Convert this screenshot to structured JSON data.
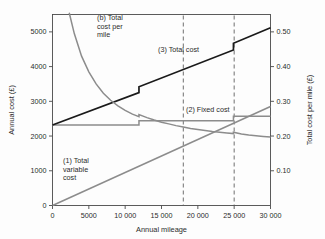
{
  "chart_data": {
    "type": "line",
    "title": "",
    "xlabel": "Annual mileage",
    "ylabel": "Annual cost (£)",
    "y2label": "Total cost per mile (£)",
    "xlim": [
      0,
      30000
    ],
    "ylim": [
      0,
      5500
    ],
    "y2lim": [
      0,
      0.55
    ],
    "grid": false,
    "legend": "annotations-inline",
    "xticks": [
      0,
      5000,
      10000,
      15000,
      20000,
      25000,
      30000
    ],
    "xticklabels": [
      "0",
      "5000",
      "10 000",
      "15 000",
      "20 000",
      "25 000",
      "30 000"
    ],
    "yticks": [
      0,
      1000,
      2000,
      3000,
      4000,
      5000
    ],
    "yticklabels": [
      "0",
      "1000",
      "2000",
      "3000",
      "4000",
      "5000"
    ],
    "y2ticks": [
      0.1,
      0.2,
      0.3,
      0.4,
      0.5
    ],
    "y2ticklabels": [
      "0.10",
      "0.20",
      "0.30",
      "0.40",
      "0.50"
    ],
    "series": [
      {
        "name": "(1) Total variable cost",
        "axis": "left",
        "color": "#8c8c8c",
        "style": "solid",
        "points": [
          [
            0,
            0
          ],
          [
            30000,
            2850
          ]
        ]
      },
      {
        "name": "(2) Fixed cost",
        "axis": "left",
        "color": "#8c8c8c",
        "style": "step",
        "points": [
          [
            0,
            2320
          ],
          [
            11900,
            2320
          ],
          [
            11900,
            2440
          ],
          [
            24900,
            2440
          ],
          [
            24900,
            2570
          ],
          [
            30000,
            2570
          ]
        ]
      },
      {
        "name": "(3) Total cost",
        "axis": "left",
        "color": "#1a1a1a",
        "style": "step",
        "points": [
          [
            0,
            2320
          ],
          [
            11900,
            3250
          ],
          [
            11900,
            3420
          ],
          [
            24900,
            4480
          ],
          [
            24900,
            4670
          ],
          [
            30000,
            5120
          ]
        ]
      },
      {
        "name": "(b) Total cost per mile",
        "axis": "right",
        "color": "#8c8c8c",
        "style": "curve",
        "points": [
          [
            2300,
            0.555
          ],
          [
            3000,
            0.495
          ],
          [
            4000,
            0.43
          ],
          [
            5000,
            0.385
          ],
          [
            6000,
            0.35
          ],
          [
            7000,
            0.323
          ],
          [
            8000,
            0.303
          ],
          [
            9000,
            0.287
          ],
          [
            10000,
            0.274
          ],
          [
            11000,
            0.263
          ],
          [
            11900,
            0.256
          ],
          [
            11900,
            0.262
          ],
          [
            13000,
            0.253
          ],
          [
            14000,
            0.246
          ],
          [
            15000,
            0.24
          ],
          [
            16000,
            0.235
          ],
          [
            17000,
            0.23
          ],
          [
            18000,
            0.226
          ],
          [
            19000,
            0.222
          ],
          [
            20000,
            0.219
          ],
          [
            21000,
            0.216
          ],
          [
            22000,
            0.213
          ],
          [
            23000,
            0.211
          ],
          [
            24000,
            0.209
          ],
          [
            24900,
            0.207
          ],
          [
            24900,
            0.211
          ],
          [
            26000,
            0.206
          ],
          [
            27000,
            0.203
          ],
          [
            28000,
            0.201
          ],
          [
            29000,
            0.199
          ],
          [
            30000,
            0.197
          ]
        ]
      }
    ],
    "reference_lines": [
      {
        "name": "dashed-18000",
        "x": 18000,
        "style": "dashed",
        "color": "#606060"
      },
      {
        "name": "dashed-25000",
        "x": 25000,
        "style": "dashed",
        "color": "#606060"
      }
    ],
    "annotations": [
      {
        "name": "annotation-cost-per-mile",
        "lines": [
          "(b) Total",
          "cost per",
          "mile"
        ],
        "x": 97,
        "y": 20
      },
      {
        "name": "annotation-total-cost",
        "lines": [
          "(3) Total cost"
        ],
        "x": 158,
        "y": 52
      },
      {
        "name": "annotation-fixed-cost",
        "lines": [
          "(2) Fixed cost"
        ],
        "x": 186,
        "y": 112
      },
      {
        "name": "annotation-total-variable-cost",
        "lines": [
          "(1) Total",
          "variable",
          "cost"
        ],
        "x": 63,
        "y": 163
      }
    ]
  },
  "colors": {
    "axis": "#4a4a4a",
    "text": "#2b2b2b",
    "total_cost": "#1a1a1a",
    "grey_series": "#8c8c8c",
    "dashed": "#606060",
    "background": "#fdfdfd"
  }
}
